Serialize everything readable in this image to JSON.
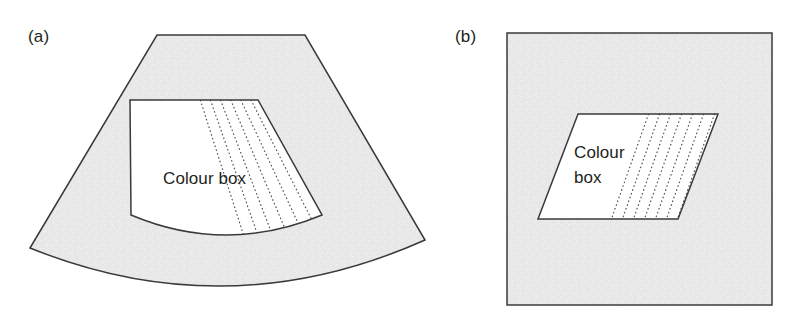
{
  "figure": {
    "background_color": "#ffffff",
    "tissue_fill_color": "#ededed",
    "colour_box_fill_color": "#ffffff",
    "outline_color": "#3a3a3c",
    "scanline_color": "#4a4a4c",
    "text_color": "#231f20"
  },
  "panels": [
    {
      "id": "a",
      "label": "(a)",
      "format": "sector",
      "colour_box_label_lines": [
        "Colour box"
      ],
      "scan_line_count": 7,
      "description": "Curvilinear sector image field with a trapezoidal colour box whose right-hand portion contains fanning dotted Doppler scan lines"
    },
    {
      "id": "b",
      "label": "(b)",
      "format": "linear",
      "colour_box_label_lines": [
        "Colour",
        "box"
      ],
      "scan_line_count": 7,
      "description": "Rectangular linear image field with a steered parallelogram colour box whose right-hand portion contains parallel dotted Doppler scan lines"
    }
  ],
  "geometry": {
    "panel_a": {
      "sector_outline": "M 157,35 L 305,35 L 425,240 Q 228,328 30,248 Z",
      "colour_box_outline": "M 130,100 L 258,100 L 322,215 Q 226,255 131,215 Z",
      "label_position": {
        "x": 28,
        "y": 42
      },
      "box_label_position": {
        "x": 163,
        "y": 184
      }
    },
    "panel_b": {
      "field_outline": "M 507,33 L 772,33 L 772,305 L 507,305 Z",
      "colour_box_outline": "M 578,114 L 718,114 L 678,219 L 538,219 Z",
      "label_position": {
        "x": 455,
        "y": 42
      },
      "box_label_position": {
        "x": 574,
        "y": 158
      }
    }
  }
}
